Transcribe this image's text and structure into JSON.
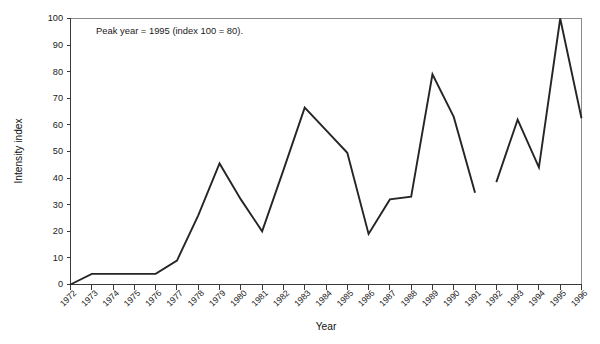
{
  "chart_data": {
    "type": "line",
    "title": "",
    "xlabel": "Year",
    "ylabel": "Intensity index",
    "xlim": [
      1972,
      1996
    ],
    "ylim": [
      0,
      100
    ],
    "grid": false,
    "legend": false,
    "legend_position": "none",
    "annotations": [
      {
        "text": "Peak year = 1995 (index 100 = 80).",
        "x": 1973.2,
        "y": 94
      }
    ],
    "ytick_labels": [
      "0",
      "10",
      "20",
      "30",
      "40",
      "50",
      "60",
      "70",
      "80",
      "90",
      "100"
    ],
    "ytick_values": [
      0,
      10,
      20,
      30,
      40,
      50,
      60,
      70,
      80,
      90,
      100
    ],
    "categories": [
      "1972",
      "1973",
      "1974",
      "1975",
      "1976",
      "1977",
      "1978",
      "1979",
      "1980",
      "1981",
      "1982",
      "1983",
      "1984",
      "1985",
      "1986",
      "1987",
      "1988",
      "1989",
      "1990",
      "1991",
      "1992",
      "1993",
      "1994",
      "1995",
      "1996"
    ],
    "series": [
      {
        "name": "Intensity index",
        "color": "#252525",
        "x": [
          1972,
          1973,
          1974,
          1975,
          1976,
          1977,
          1978,
          1979,
          1980,
          1981,
          1982,
          1983,
          1984,
          1985,
          1986,
          1987,
          1988,
          1989,
          1990,
          1991
        ],
        "values": [
          0,
          4,
          4,
          4,
          4,
          9,
          26,
          45.5,
          32,
          20,
          43,
          66.5,
          58,
          49.5,
          19,
          32,
          33,
          79,
          63,
          34.5
        ]
      },
      {
        "name": "Intensity index (continued)",
        "color": "#252525",
        "x": [
          1992,
          1993,
          1994,
          1995,
          1996
        ],
        "values": [
          38.5,
          62,
          44,
          100,
          62.5
        ]
      }
    ]
  }
}
